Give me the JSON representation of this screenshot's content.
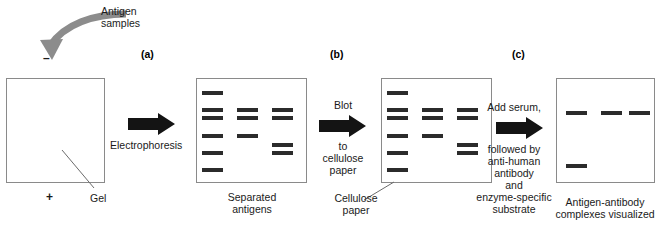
{
  "diagram": {
    "panels": [
      {
        "key": "a",
        "label": "(a)"
      },
      {
        "key": "b",
        "label": "(b)"
      },
      {
        "key": "c",
        "label": "(c)"
      }
    ],
    "annotations": {
      "antigen_samples": "Antigen\nsamples",
      "negative_electrode": "–",
      "positive_electrode": "+",
      "gel_label": "Gel",
      "cellulose_paper_label": "Cellulose\npaper"
    },
    "steps": [
      {
        "name": "electrophoresis",
        "label_above": "",
        "label_below": "Electrophoresis",
        "arrow": "right-block-arrow",
        "arrow_color": "#141414"
      },
      {
        "name": "blot",
        "label_above": "Blot",
        "label_below": "to\ncellulose\npaper",
        "arrow": "right-block-arrow",
        "arrow_color": "#141414"
      },
      {
        "name": "detect",
        "label_above": "Add serum,",
        "label_below": "followed by\nanti-human\nantibody\nand\nenzyme-specific\nsubstrate",
        "arrow": "right-block-arrow",
        "arrow_color": "#141414"
      }
    ],
    "stages": [
      {
        "key": "gel",
        "caption": "",
        "box": {
          "x": 6,
          "y": 78,
          "w": 99,
          "h": 105
        },
        "bands": []
      },
      {
        "key": "separated_antigens",
        "caption": "Separated\nantigens",
        "box": {
          "x": 196,
          "y": 78,
          "w": 111,
          "h": 105
        },
        "bands": [
          {
            "lane": 1,
            "x": 202,
            "y": 91,
            "w": 21,
            "h": 4
          },
          {
            "lane": 1,
            "x": 202,
            "y": 108,
            "w": 21,
            "h": 4
          },
          {
            "lane": 1,
            "x": 202,
            "y": 116,
            "w": 21,
            "h": 4
          },
          {
            "lane": 1,
            "x": 202,
            "y": 134,
            "w": 21,
            "h": 4
          },
          {
            "lane": 1,
            "x": 202,
            "y": 151,
            "w": 21,
            "h": 4
          },
          {
            "lane": 1,
            "x": 202,
            "y": 168,
            "w": 21,
            "h": 4
          },
          {
            "lane": 2,
            "x": 237,
            "y": 108,
            "w": 21,
            "h": 4
          },
          {
            "lane": 2,
            "x": 237,
            "y": 116,
            "w": 21,
            "h": 4
          },
          {
            "lane": 2,
            "x": 237,
            "y": 134,
            "w": 21,
            "h": 4
          },
          {
            "lane": 3,
            "x": 272,
            "y": 108,
            "w": 21,
            "h": 4
          },
          {
            "lane": 3,
            "x": 272,
            "y": 116,
            "w": 21,
            "h": 4
          },
          {
            "lane": 3,
            "x": 272,
            "y": 143,
            "w": 21,
            "h": 4
          },
          {
            "lane": 3,
            "x": 272,
            "y": 151,
            "w": 21,
            "h": 4
          }
        ]
      },
      {
        "key": "cellulose_paper",
        "caption": "",
        "box": {
          "x": 381,
          "y": 78,
          "w": 111,
          "h": 105
        },
        "bands": [
          {
            "lane": 1,
            "x": 387,
            "y": 91,
            "w": 21,
            "h": 4
          },
          {
            "lane": 1,
            "x": 387,
            "y": 108,
            "w": 21,
            "h": 4
          },
          {
            "lane": 1,
            "x": 387,
            "y": 116,
            "w": 21,
            "h": 4
          },
          {
            "lane": 1,
            "x": 387,
            "y": 134,
            "w": 21,
            "h": 4
          },
          {
            "lane": 1,
            "x": 387,
            "y": 151,
            "w": 21,
            "h": 4
          },
          {
            "lane": 1,
            "x": 387,
            "y": 168,
            "w": 21,
            "h": 4
          },
          {
            "lane": 2,
            "x": 422,
            "y": 108,
            "w": 21,
            "h": 4
          },
          {
            "lane": 2,
            "x": 422,
            "y": 116,
            "w": 21,
            "h": 4
          },
          {
            "lane": 2,
            "x": 422,
            "y": 134,
            "w": 21,
            "h": 4
          },
          {
            "lane": 3,
            "x": 457,
            "y": 108,
            "w": 21,
            "h": 4
          },
          {
            "lane": 3,
            "x": 457,
            "y": 116,
            "w": 21,
            "h": 4
          },
          {
            "lane": 3,
            "x": 457,
            "y": 143,
            "w": 21,
            "h": 4
          },
          {
            "lane": 3,
            "x": 457,
            "y": 151,
            "w": 21,
            "h": 4
          }
        ]
      },
      {
        "key": "visualized",
        "caption": "Antigen-antibody\ncomplexes visualized",
        "box": {
          "x": 556,
          "y": 78,
          "w": 99,
          "h": 105
        },
        "bands": [
          {
            "lane": 1,
            "x": 565,
            "y": 110,
            "w": 21,
            "h": 4
          },
          {
            "lane": 2,
            "x": 600,
            "y": 110,
            "w": 21,
            "h": 4
          },
          {
            "lane": 3,
            "x": 634,
            "y": 110,
            "w": 21,
            "h": 4
          },
          {
            "lane": 1,
            "x": 565,
            "y": 163,
            "w": 21,
            "h": 4
          }
        ]
      }
    ]
  }
}
